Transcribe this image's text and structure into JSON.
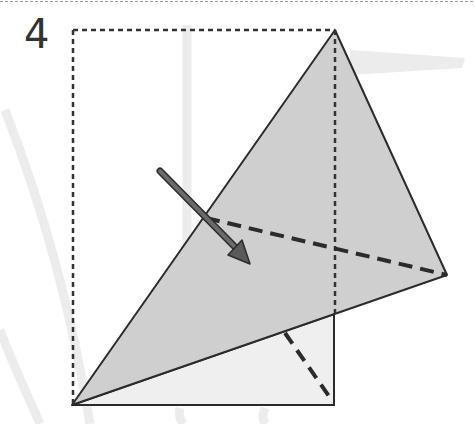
{
  "step": {
    "number": "4"
  },
  "colors": {
    "outline": "#2b2b2b",
    "folded_fill": "#cfcfcf",
    "under_fill": "#efefef",
    "arrow": "#5a5a5a",
    "background_shape": "#ececec"
  },
  "diagram": {
    "elements": [
      "dotted-original-square-outline",
      "folded-flap-gray",
      "underlying-light-triangle",
      "dashed-crease-upper",
      "dashed-crease-lower",
      "fold-direction-arrow"
    ]
  }
}
